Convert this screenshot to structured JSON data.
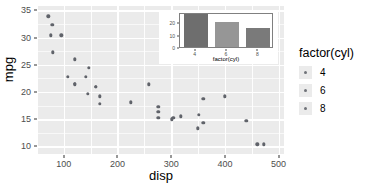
{
  "chart_data": [
    {
      "type": "scatter",
      "title": "",
      "xlabel": "disp",
      "ylabel": "mpg",
      "xlim": [
        52,
        510
      ],
      "ylim": [
        8.6,
        35.8
      ],
      "xticks": [
        100,
        200,
        300,
        400,
        500
      ],
      "yticks": [
        10,
        15,
        20,
        25,
        30,
        35
      ],
      "grid": true,
      "legend": {
        "position": "right",
        "title": "factor(cyl)",
        "entries": [
          {
            "label": "4",
            "color": "#707379"
          },
          {
            "label": "6",
            "color": "#707379"
          },
          {
            "label": "8",
            "color": "#707379"
          }
        ]
      },
      "point_color": "#60636a",
      "panel_background": "#ebebeb",
      "gridline_color": "#ffffff",
      "points": [
        {
          "x": 160.0,
          "y": 21.0,
          "cyl": 6
        },
        {
          "x": 160.0,
          "y": 21.0,
          "cyl": 6
        },
        {
          "x": 108.0,
          "y": 22.8,
          "cyl": 4
        },
        {
          "x": 258.0,
          "y": 21.4,
          "cyl": 6
        },
        {
          "x": 360.0,
          "y": 18.7,
          "cyl": 8
        },
        {
          "x": 225.0,
          "y": 18.1,
          "cyl": 6
        },
        {
          "x": 360.0,
          "y": 14.3,
          "cyl": 8
        },
        {
          "x": 146.7,
          "y": 24.4,
          "cyl": 4
        },
        {
          "x": 140.8,
          "y": 22.8,
          "cyl": 4
        },
        {
          "x": 167.6,
          "y": 19.2,
          "cyl": 6
        },
        {
          "x": 167.6,
          "y": 17.8,
          "cyl": 6
        },
        {
          "x": 275.8,
          "y": 16.4,
          "cyl": 8
        },
        {
          "x": 275.8,
          "y": 17.3,
          "cyl": 8
        },
        {
          "x": 275.8,
          "y": 15.2,
          "cyl": 8
        },
        {
          "x": 472.0,
          "y": 10.4,
          "cyl": 8
        },
        {
          "x": 460.0,
          "y": 10.4,
          "cyl": 8
        },
        {
          "x": 440.0,
          "y": 14.7,
          "cyl": 8
        },
        {
          "x": 78.7,
          "y": 32.4,
          "cyl": 4
        },
        {
          "x": 75.7,
          "y": 30.4,
          "cyl": 4
        },
        {
          "x": 71.1,
          "y": 33.9,
          "cyl": 4
        },
        {
          "x": 120.1,
          "y": 21.5,
          "cyl": 4
        },
        {
          "x": 318.0,
          "y": 15.5,
          "cyl": 8
        },
        {
          "x": 304.0,
          "y": 15.2,
          "cyl": 8
        },
        {
          "x": 350.0,
          "y": 13.3,
          "cyl": 8
        },
        {
          "x": 400.0,
          "y": 19.2,
          "cyl": 8
        },
        {
          "x": 79.0,
          "y": 27.3,
          "cyl": 4
        },
        {
          "x": 120.3,
          "y": 26.0,
          "cyl": 4
        },
        {
          "x": 95.1,
          "y": 30.4,
          "cyl": 4
        },
        {
          "x": 351.0,
          "y": 15.8,
          "cyl": 8
        },
        {
          "x": 145.0,
          "y": 19.7,
          "cyl": 6
        },
        {
          "x": 301.0,
          "y": 15.0,
          "cyl": 8
        },
        {
          "x": 121.0,
          "y": 21.4,
          "cyl": 4
        }
      ]
    },
    {
      "type": "bar",
      "title": "",
      "xlabel": "factor(cyl)",
      "ylabel": "",
      "categories": [
        "4",
        "6",
        "8"
      ],
      "values": [
        26.66,
        19.74,
        15.1
      ],
      "colors": [
        "#6e6e6e",
        "#969696",
        "#7a7a7a"
      ],
      "yticks": [
        0,
        10,
        20
      ],
      "ylim": [
        0,
        28
      ],
      "grid": false,
      "panel_background": "#ffffff",
      "border_color": "#808080",
      "position": "inset-top-right"
    }
  ],
  "main_chart": {
    "x_axis_title": "disp",
    "y_axis_title": "mpg",
    "x_tick_labels": [
      "100",
      "200",
      "300",
      "400",
      "500"
    ],
    "y_tick_labels": [
      "10",
      "15",
      "20",
      "25",
      "30",
      "35"
    ]
  },
  "legend": {
    "title": "factor(cyl)",
    "items": [
      {
        "label": "4"
      },
      {
        "label": "6"
      },
      {
        "label": "8"
      }
    ]
  },
  "inset_chart": {
    "x_axis_title": "factor(cyl)",
    "x_tick_labels": [
      "4",
      "6",
      "8"
    ],
    "y_tick_labels": [
      "0",
      "10",
      "20"
    ]
  }
}
